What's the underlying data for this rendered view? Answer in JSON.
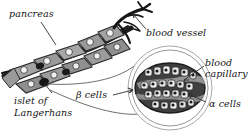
{
  "figure": {
    "background_color": "#ffffff",
    "style": "grayscale biological illustration"
  },
  "labels": {
    "pancreas": "pancreas",
    "blood_vessel": "blood vessel",
    "blood_capillary_line1": "blood",
    "blood_capillary_line2": "capillary",
    "alpha_cells": "α cells",
    "beta_cells": "β cells",
    "islet_line1": "islet of",
    "islet_line2": "Langerhans"
  },
  "colors": {
    "ink": "#141414",
    "leader_line": "#3a3a3a",
    "lobule_fill": "#9a9a9a",
    "lobule_dark": "#6f6f6f",
    "vessel_dark": "#1e1e1e",
    "islet_ring": "#8c8c8c",
    "islet_body": "#4a4a4a",
    "cell_light": "#e9e9e9",
    "nucleus": "#202020"
  },
  "parts": [
    {
      "name": "pancreas-organ",
      "description": "chain of gray lobules with pale nuclei"
    },
    {
      "name": "blood-vessel",
      "description": "dark branching vessel at upper right of pancreas"
    },
    {
      "name": "islet-of-langerhans",
      "description": "dark spot embedded in pancreas lobules"
    },
    {
      "name": "magnified-islet-inset",
      "description": "circular magnification showing alpha and beta cells around a capillary"
    }
  ]
}
